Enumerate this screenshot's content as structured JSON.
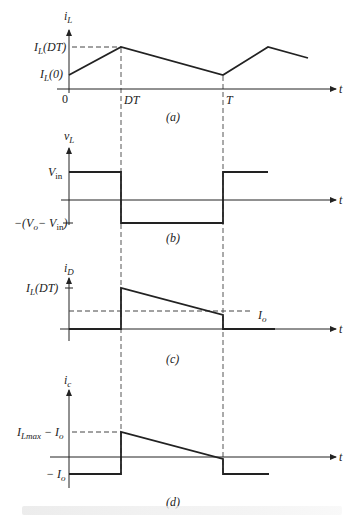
{
  "figure": {
    "panels": [
      {
        "id": "a",
        "panel_label": "(a)",
        "y_axis_label": "i",
        "y_axis_sub": "L",
        "x_axis_label": "t",
        "y_ticks": [
          {
            "text": "I",
            "sub": "L",
            "suffix": "(DT)"
          },
          {
            "text": "I",
            "sub": "L",
            "suffix": "(0)"
          }
        ],
        "x_ticks": [
          "0",
          "DT",
          "T"
        ]
      },
      {
        "id": "b",
        "panel_label": "(b)",
        "y_axis_label": "v",
        "y_axis_sub": "L",
        "x_axis_label": "t",
        "y_ticks": [
          {
            "text": "V",
            "sub": "in",
            "suffix": ""
          },
          {
            "text": "−(V",
            "sub": "o",
            "suffix": "− V",
            "sub2": "in",
            "suffix2": ")"
          }
        ]
      },
      {
        "id": "c",
        "panel_label": "(c)",
        "y_axis_label": "i",
        "y_axis_sub": "D",
        "x_axis_label": "t",
        "y_ticks": [
          {
            "text": "I",
            "sub": "L",
            "suffix": "(DT)"
          }
        ],
        "level_label": {
          "text": "I",
          "sub": "o"
        }
      },
      {
        "id": "d",
        "panel_label": "(d)",
        "y_axis_label": "i",
        "y_axis_sub": "c",
        "x_axis_label": "t",
        "y_ticks": [
          {
            "text": "I",
            "sub": "Lmax",
            "suffix": " − I",
            "sub2": "o"
          },
          {
            "text": "− I",
            "sub": "o",
            "suffix": ""
          }
        ]
      }
    ],
    "colors": {
      "line": "#222222",
      "dashed": "#444444",
      "background": "#ffffff"
    }
  }
}
